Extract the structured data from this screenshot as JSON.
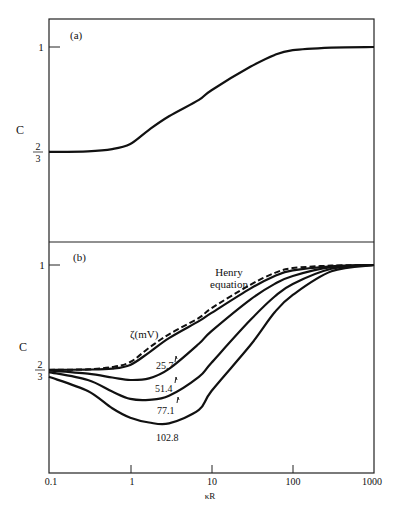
{
  "chart_data": [
    {
      "panel": "(a)",
      "type": "line",
      "title": "",
      "xlabel": "κR",
      "ylabel": "C",
      "xscale": "log",
      "xlim": [
        0.1,
        1000
      ],
      "yticks": [
        {
          "value": 0.6667,
          "label_num": "2",
          "label_den": "3"
        },
        {
          "value": 1,
          "label": "1"
        }
      ],
      "grid": false,
      "series": [
        {
          "name": "C(κR)",
          "style": "solid",
          "x": [
            0.1,
            0.3,
            0.6,
            1,
            1.7,
            3,
            7,
            10,
            30,
            60,
            100,
            300,
            1000
          ],
          "y": [
            0.667,
            0.669,
            0.676,
            0.692,
            0.737,
            0.78,
            0.832,
            0.863,
            0.937,
            0.975,
            0.99,
            0.998,
            1.0
          ]
        }
      ]
    },
    {
      "panel": "(b)",
      "type": "line",
      "title": "",
      "xlabel": "κR",
      "ylabel": "C",
      "xscale": "log",
      "xlim": [
        0.1,
        1000
      ],
      "xticks": [
        "0.1",
        "1",
        "10",
        "100",
        "1000"
      ],
      "yticks": [
        {
          "value": 0.6667,
          "label_num": "2",
          "label_den": "3"
        },
        {
          "value": 1,
          "label": "1"
        }
      ],
      "legend_title": "ζ(mV)",
      "annotations": [
        "Henry equation",
        "25.7",
        "51.4",
        "77.1",
        "102.8"
      ],
      "grid": false,
      "series": [
        {
          "name": "Henry equation",
          "style": "dashed",
          "x": [
            0.1,
            0.3,
            0.6,
            1,
            1.7,
            3,
            7,
            10,
            30,
            60,
            100,
            300,
            1000
          ],
          "y": [
            0.667,
            0.669,
            0.676,
            0.692,
            0.737,
            0.78,
            0.832,
            0.863,
            0.937,
            0.975,
            0.99,
            0.998,
            1.0
          ]
        },
        {
          "name": "25.7",
          "style": "solid",
          "x": [
            0.1,
            0.3,
            0.6,
            1,
            1.7,
            3,
            7,
            10,
            30,
            60,
            100,
            300,
            1000
          ],
          "y": [
            0.667,
            0.668,
            0.671,
            0.683,
            0.722,
            0.768,
            0.822,
            0.848,
            0.925,
            0.965,
            0.983,
            0.996,
            1.0
          ]
        },
        {
          "name": "51.4",
          "style": "solid",
          "x": [
            0.1,
            0.3,
            0.6,
            1,
            1.7,
            3,
            7,
            10,
            30,
            60,
            100,
            300,
            1000
          ],
          "y": [
            0.665,
            0.655,
            0.643,
            0.635,
            0.64,
            0.67,
            0.75,
            0.79,
            0.89,
            0.94,
            0.965,
            0.993,
            1.0
          ]
        },
        {
          "name": "77.1",
          "style": "solid",
          "x": [
            0.1,
            0.3,
            0.6,
            1,
            1.7,
            3,
            7,
            10,
            30,
            60,
            100,
            300,
            1000
          ],
          "y": [
            0.66,
            0.635,
            0.598,
            0.575,
            0.572,
            0.585,
            0.645,
            0.69,
            0.825,
            0.9,
            0.94,
            0.988,
            1.0
          ]
        },
        {
          "name": "102.8",
          "style": "solid",
          "x": [
            0.1,
            0.3,
            0.6,
            1,
            1.7,
            3,
            7,
            10,
            30,
            60,
            100,
            300,
            1000
          ],
          "y": [
            0.645,
            0.6,
            0.545,
            0.515,
            0.5,
            0.497,
            0.54,
            0.6,
            0.745,
            0.85,
            0.905,
            0.98,
            1.0
          ]
        }
      ]
    }
  ],
  "labels": {
    "panel_a": "(a)",
    "panel_b": "(b)",
    "ylabel": "C",
    "xlabel": "κR",
    "y_one": "1",
    "y_two_thirds_num": "2",
    "y_two_thirds_den": "3",
    "henry_line1": "Henry",
    "henry_line2": "equation",
    "zeta_label": "ζ(mV)",
    "curve_25": "25.7",
    "curve_51": "51.4",
    "curve_77": "77.1",
    "curve_102": "102.8",
    "xticks": [
      "0.1",
      "1",
      "10",
      "100",
      "1000"
    ]
  }
}
